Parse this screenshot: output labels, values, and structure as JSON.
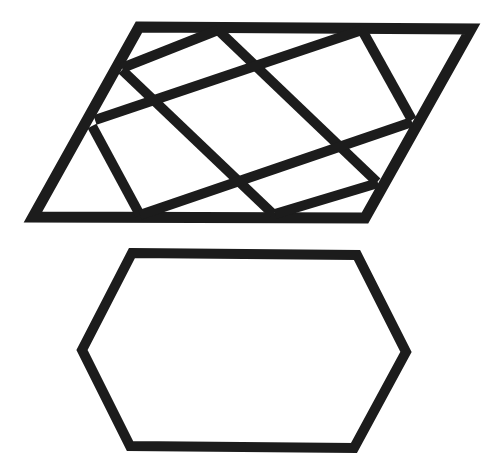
{
  "figure": {
    "width": 492,
    "height": 475,
    "background": "#ffffff",
    "stroke_color": "#1c1c1c",
    "shapes": {
      "parallelogram": {
        "name": "dissected-parallelogram",
        "stroke_width": 11,
        "outline": [
          [
            139,
            27
          ],
          [
            471,
            29
          ],
          [
            365,
            218
          ],
          [
            33,
            217
          ]
        ],
        "cut_lines": [
          {
            "id": "cut-a",
            "from": [
              122,
              68
            ],
            "to": [
              218,
              30
            ]
          },
          {
            "id": "cut-b1",
            "from": [
              218,
              30
            ],
            "to": [
              377,
              182
            ]
          },
          {
            "id": "cut-b2",
            "from": [
              122,
              70
            ],
            "to": [
              273,
              214
            ]
          },
          {
            "id": "cut-c",
            "from": [
              95,
              120
            ],
            "to": [
              362,
              30
            ]
          },
          {
            "id": "cut-d",
            "from": [
              362,
              30
            ],
            "to": [
              412,
              120
            ]
          },
          {
            "id": "cut-e",
            "from": [
              92,
              126
            ],
            "to": [
              140,
              215
            ]
          },
          {
            "id": "cut-f",
            "from": [
              140,
              215
            ],
            "to": [
              412,
              122
            ]
          },
          {
            "id": "cut-g",
            "from": [
              275,
              214
            ],
            "to": [
              378,
              183
            ]
          }
        ]
      },
      "hexagon": {
        "name": "hexagon",
        "stroke_width": 10,
        "outline": [
          [
            132,
            253
          ],
          [
            357,
            255
          ],
          [
            406,
            352
          ],
          [
            354,
            448
          ],
          [
            130,
            446
          ],
          [
            82,
            350
          ]
        ]
      }
    }
  }
}
